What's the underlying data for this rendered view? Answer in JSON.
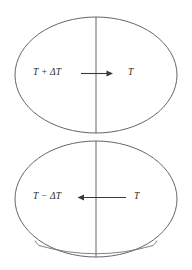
{
  "figure": {
    "type": "thermodynamic-diagram",
    "background_color": "#ffffff",
    "line_color": "#555555",
    "arrow_color": "#3a3a3a",
    "brace_color": "#6a6a6a",
    "text_color": "#2b2b2b",
    "panels": [
      {
        "id": "top",
        "shape": "ellipse",
        "divider": "vertical-diameter",
        "left_label": "T + ΔT",
        "right_label": "T",
        "arrow_direction": "right",
        "has_brace": false
      },
      {
        "id": "bottom",
        "shape": "ellipse",
        "divider": "vertical-diameter",
        "left_label": "T − ΔT",
        "right_label": "T",
        "arrow_direction": "left",
        "has_brace": true
      }
    ]
  }
}
